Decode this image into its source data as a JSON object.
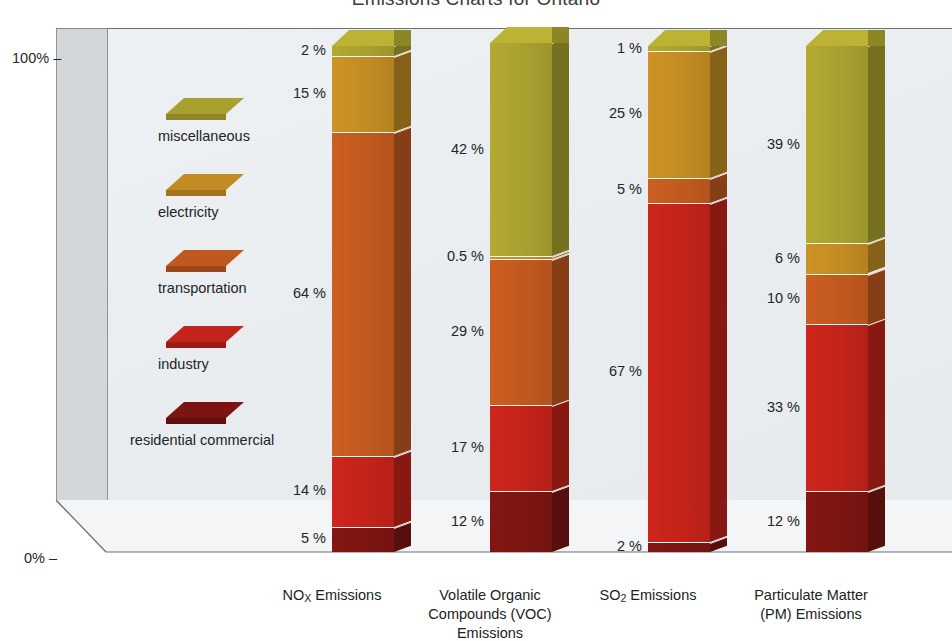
{
  "title": "Emissions Charts for Ontario",
  "axis": {
    "y_top_label": "100%",
    "y_bottom_label": "0%",
    "tick_dash": "–"
  },
  "legend": {
    "items": [
      {
        "label": "miscellaneous",
        "color": "#a8a02f",
        "key": "miscellaneous"
      },
      {
        "label": "electricity",
        "color": "#c28b23",
        "key": "electricity"
      },
      {
        "label": "transportation",
        "color": "#c0591f",
        "key": "transportation"
      },
      {
        "label": "industry",
        "color": "#c2231a",
        "key": "industry"
      },
      {
        "label": "residential commercial",
        "color": "#7c1512",
        "key": "residential_commercial"
      }
    ]
  },
  "colors": {
    "miscellaneous": "#a8a02f",
    "electricity": "#c28b23",
    "transportation": "#c0591f",
    "industry": "#c2231a",
    "residential_commercial": "#7c1512",
    "plot_background": "#e9edef",
    "wall_line": "#6d7275",
    "segment_divider": "#fbf6ef",
    "text": "#232527"
  },
  "chart_data": {
    "type": "bar",
    "subtype": "100% stacked column (3D)",
    "title": "Emissions Charts for Ontario",
    "xlabel": "",
    "ylabel": "",
    "ylim": [
      0,
      100
    ],
    "y_tick_labels": [
      "0%",
      "100%"
    ],
    "grid": false,
    "legend_position": "inside-left",
    "stack_order_bottom_to_top": [
      "residential commercial",
      "industry",
      "transportation",
      "electricity",
      "miscellaneous"
    ],
    "categories": [
      "NOX Emissions",
      "Volatile Organic Compounds (VOC) Emissions",
      "SO2 Emissions",
      "Particulate Matter (PM) Emissions"
    ],
    "series": [
      {
        "name": "miscellaneous",
        "values": [
          2,
          42,
          1,
          39
        ]
      },
      {
        "name": "electricity",
        "values": [
          15,
          0.5,
          25,
          6
        ]
      },
      {
        "name": "transportation",
        "values": [
          64,
          29,
          5,
          10
        ]
      },
      {
        "name": "industry",
        "values": [
          14,
          17,
          67,
          33
        ]
      },
      {
        "name": "residential commercial",
        "values": [
          5,
          12,
          2,
          12
        ]
      }
    ],
    "data_labels": {
      "nox": [
        "2 %",
        "15 %",
        "64 %",
        "14 %",
        "5 %"
      ],
      "voc": [
        "42 %",
        "0.5 %",
        "29 %",
        "17 %",
        "12 %"
      ],
      "so2": [
        "1 %",
        "25 %",
        "5 %",
        "67 %",
        "2 %"
      ],
      "pm": [
        "39 %",
        "6 %",
        "10 %",
        "33 %",
        "12 %"
      ]
    }
  },
  "bars": {
    "nox": {
      "caption_line1": "NO",
      "caption_sub": "X",
      "caption_line1b": " Emissions",
      "segments": [
        {
          "name": "miscellaneous",
          "pct": 2,
          "label": "2 %"
        },
        {
          "name": "electricity",
          "pct": 15,
          "label": "15 %"
        },
        {
          "name": "transportation",
          "pct": 64,
          "label": "64 %"
        },
        {
          "name": "industry",
          "pct": 14,
          "label": "14 %"
        },
        {
          "name": "residential commercial",
          "pct": 5,
          "label": "5 %"
        }
      ]
    },
    "voc": {
      "caption_line1": "Volatile Organic",
      "caption_line2": "Compounds (VOC)",
      "caption_line3": "Emissions",
      "segments": [
        {
          "name": "miscellaneous",
          "pct": 42,
          "label": "42 %"
        },
        {
          "name": "electricity",
          "pct": 0.5,
          "label": "0.5 %"
        },
        {
          "name": "transportation",
          "pct": 29,
          "label": "29 %"
        },
        {
          "name": "industry",
          "pct": 17,
          "label": "17 %"
        },
        {
          "name": "residential commercial",
          "pct": 12,
          "label": "12 %"
        }
      ]
    },
    "so2": {
      "caption_line1": "SO",
      "caption_sub": "2",
      "caption_line1b": " Emissions",
      "segments": [
        {
          "name": "miscellaneous",
          "pct": 1,
          "label": "1 %"
        },
        {
          "name": "electricity",
          "pct": 25,
          "label": "25 %"
        },
        {
          "name": "transportation",
          "pct": 5,
          "label": "5 %"
        },
        {
          "name": "industry",
          "pct": 67,
          "label": "67 %"
        },
        {
          "name": "residential commercial",
          "pct": 2,
          "label": "2 %"
        }
      ]
    },
    "pm": {
      "caption_line1": "Particulate Matter",
      "caption_line2": "(PM) Emissions",
      "segments": [
        {
          "name": "miscellaneous",
          "pct": 39,
          "label": "39 %"
        },
        {
          "name": "electricity",
          "pct": 6,
          "label": "6 %"
        },
        {
          "name": "transportation",
          "pct": 10,
          "label": "10 %"
        },
        {
          "name": "industry",
          "pct": 33,
          "label": "33 %"
        },
        {
          "name": "residential commercial",
          "pct": 12,
          "label": "12 %"
        }
      ]
    }
  }
}
